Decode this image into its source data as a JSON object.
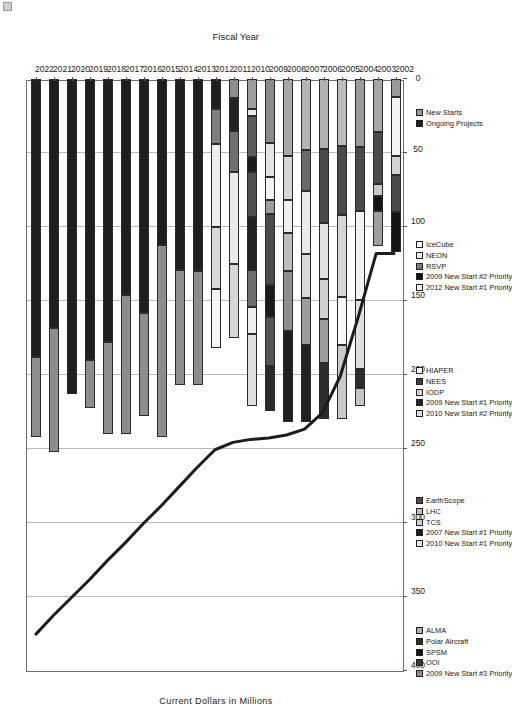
{
  "chart_data": {
    "type": "bar",
    "orientation": "horizontal",
    "stacked": true,
    "title": "",
    "xlabel": "Fiscal Year",
    "ylabel": "Current Dollars in Millions",
    "categories": [
      "2002",
      "2003",
      "2004",
      "2005",
      "2006",
      "2007",
      "2008",
      "2009",
      "2010",
      "2011",
      "2012",
      "2013",
      "2014",
      "2015",
      "2016",
      "2017",
      "2018",
      "2019",
      "2020",
      "2021",
      "2022"
    ],
    "value_ticks": [
      0,
      50,
      100,
      150,
      200,
      250,
      300,
      350,
      400
    ],
    "ylim": [
      0,
      400
    ],
    "grid": true,
    "legend_position": "right",
    "bar_totals": [
      117,
      113,
      221,
      230,
      230,
      232,
      232,
      224,
      221,
      202,
      182,
      207,
      207,
      242,
      228,
      240,
      240,
      222,
      213,
      252,
      242
    ],
    "annotation_line": {
      "name": "Budget Ceiling",
      "x": [
        "2002",
        "2003",
        "2004",
        "2005",
        "2006",
        "2007",
        "2008",
        "2009",
        "2010",
        "2011",
        "2012",
        "2013",
        "2014",
        "2015",
        "2016",
        "2017",
        "2018",
        "2019",
        "2020",
        "2021",
        "2022"
      ],
      "y": [
        117,
        117,
        160,
        200,
        225,
        236,
        240,
        242,
        243,
        245,
        250,
        262,
        275,
        288,
        300,
        313,
        325,
        338,
        350,
        362,
        375
      ]
    },
    "series": [
      {
        "name": "ALMA",
        "color": "#b0b0b0"
      },
      {
        "name": "Polar Aircraft",
        "color": "#2e2e2e"
      },
      {
        "name": "SPSM",
        "color": "#151515"
      },
      {
        "name": "OOI",
        "color": "#3a3a3a"
      },
      {
        "name": "2009 New Start #3 Priority",
        "color": "#8e8e8e"
      },
      {
        "name": "EarthScope",
        "color": "#4d4d4d"
      },
      {
        "name": "LHC",
        "color": "#bdbdbd"
      },
      {
        "name": "TCS",
        "color": "#cfcfcf"
      },
      {
        "name": "2007 New Start #1 Priority",
        "color": "#1c1c1c"
      },
      {
        "name": "2010 New Start #1 Priority",
        "color": "#e7e7e7"
      },
      {
        "name": "HIAPER",
        "color": "#fafafa"
      },
      {
        "name": "NEES",
        "color": "#3f3f3f"
      },
      {
        "name": "IODP",
        "color": "#d4d4d4"
      },
      {
        "name": "2009 New Start #1 Priority",
        "color": "#242424"
      },
      {
        "name": "2010 New Start #2 Priority",
        "color": "#dcdcdc"
      },
      {
        "name": "IceCube",
        "color": "#fdfdfd"
      },
      {
        "name": "NEON",
        "color": "#eaeaea"
      },
      {
        "name": "RSVP",
        "color": "#7a7a7a"
      },
      {
        "name": "2009 New Start #2 Priority",
        "color": "#111111"
      },
      {
        "name": "2012 New Start #1 Priority",
        "color": "#f2f2f2"
      },
      {
        "name": "New Starts",
        "color": "#9a9a9a"
      },
      {
        "name": "Ongoing Projects",
        "color": "#1f1f1f"
      }
    ],
    "bars": [
      {
        "year": "2002",
        "segments": [
          {
            "name": "ALMA",
            "value": 12,
            "color": "#9a9a9a"
          },
          {
            "name": "HIAPER",
            "value": 40,
            "color": "#f4f4f4"
          },
          {
            "name": "IODP",
            "value": 13,
            "color": "#d2d2d2"
          },
          {
            "name": "EarthScope",
            "value": 25,
            "color": "#4a4a4a"
          },
          {
            "name": "Polar Aircraft",
            "value": 27,
            "color": "#141414"
          }
        ]
      },
      {
        "year": "2003",
        "segments": [
          {
            "name": "ALMA",
            "value": 36,
            "color": "#a6a6a6"
          },
          {
            "name": "EarthScope",
            "value": 35,
            "color": "#4a4a4a"
          },
          {
            "name": "IODP",
            "value": 8,
            "color": "#c9c9c9"
          },
          {
            "name": "Polar Aircraft",
            "value": 10,
            "color": "#151515"
          },
          {
            "name": "NEES",
            "value": 24,
            "color": "#9f9f9f"
          }
        ]
      },
      {
        "year": "2004",
        "segments": [
          {
            "name": "ALMA",
            "value": 46,
            "color": "#9c9c9c"
          },
          {
            "name": "EarthScope",
            "value": 43,
            "color": "#4a4a4a"
          },
          {
            "name": "HIAPER",
            "value": 60,
            "color": "#f2f2f2"
          },
          {
            "name": "TCS",
            "value": 47,
            "color": "#e0e0e0"
          },
          {
            "name": "Polar Aircraft",
            "value": 13,
            "color": "#2b2b2b"
          },
          {
            "name": "IODP",
            "value": 12,
            "color": "#c4c4c4"
          }
        ]
      },
      {
        "year": "2005",
        "segments": [
          {
            "name": "ALMA",
            "value": 45,
            "color": "#bdbdbd"
          },
          {
            "name": "EarthScope",
            "value": 47,
            "color": "#4a4a4a"
          },
          {
            "name": "TCS",
            "value": 55,
            "color": "#d6d6d6"
          },
          {
            "name": "IceCube",
            "value": 33,
            "color": "#f7f7f7"
          },
          {
            "name": "IODP",
            "value": 50,
            "color": "#cacaca"
          }
        ]
      },
      {
        "year": "2006",
        "segments": [
          {
            "name": "ALMA",
            "value": 47,
            "color": "#b2b2b2"
          },
          {
            "name": "EarthScope",
            "value": 50,
            "color": "#4a4a4a"
          },
          {
            "name": "TCS",
            "value": 38,
            "color": "#e2e2e2"
          },
          {
            "name": "IceCube",
            "value": 27,
            "color": "#d0d0d0"
          },
          {
            "name": "IODP",
            "value": 30,
            "color": "#9b9b9b"
          },
          {
            "name": "Polar Aircraft",
            "value": 38,
            "color": "#2d2d2d"
          }
        ]
      },
      {
        "year": "2007",
        "segments": [
          {
            "name": "ALMA",
            "value": 48,
            "color": "#b5b5b5"
          },
          {
            "name": "EarthScope",
            "value": 28,
            "color": "#6a6a6a"
          },
          {
            "name": "TCS",
            "value": 42,
            "color": "#ebebeb"
          },
          {
            "name": "IceCube",
            "value": 30,
            "color": "#d8d8d8"
          },
          {
            "name": "IODP",
            "value": 32,
            "color": "#9d9d9d"
          },
          {
            "name": "2007 New Start #1 Priority",
            "value": 52,
            "color": "#222222"
          }
        ]
      },
      {
        "year": "2008",
        "segments": [
          {
            "name": "ALMA",
            "value": 52,
            "color": "#a8a8a8"
          },
          {
            "name": "EarthScope",
            "value": 30,
            "color": "#d7d7d7"
          },
          {
            "name": "TCS",
            "value": 22,
            "color": "#f0f0f0"
          },
          {
            "name": "IceCube",
            "value": 26,
            "color": "#bebebe"
          },
          {
            "name": "IODP",
            "value": 40,
            "color": "#8f8f8f"
          },
          {
            "name": "2007 New Start #1 Priority",
            "value": 62,
            "color": "#1f1f1f"
          }
        ]
      },
      {
        "year": "2009",
        "segments": [
          {
            "name": "ALMA",
            "value": 43,
            "color": "#8b8b8b"
          },
          {
            "name": "EarthScope",
            "value": 23,
            "color": "#e4e4e4"
          },
          {
            "name": "TCS",
            "value": 16,
            "color": "#f3f3f3"
          },
          {
            "name": "IceCube",
            "value": 9,
            "color": "#9c9c9c"
          },
          {
            "name": "IODP",
            "value": 48,
            "color": "#4b4b4b"
          },
          {
            "name": "2009 New Start #1 Priority",
            "value": 22,
            "color": "#1a1a1a"
          },
          {
            "name": "2009 New Start #2 Priority",
            "value": 33,
            "color": "#555555"
          },
          {
            "name": "2009 New Start #3 Priority",
            "value": 30,
            "color": "#2a2a2a"
          }
        ]
      },
      {
        "year": "2010",
        "segments": [
          {
            "name": "ALMA",
            "value": 20,
            "color": "#9e9e9e"
          },
          {
            "name": "NEON",
            "value": 5,
            "color": "#e8e8e8"
          },
          {
            "name": "IODP",
            "value": 28,
            "color": "#5a5a5a"
          },
          {
            "name": "EarthScope",
            "value": 10,
            "color": "#1b1b1b"
          },
          {
            "name": "TCS",
            "value": 30,
            "color": "#4e4e4e"
          },
          {
            "name": "2009 New Start #1 Priority",
            "value": 36,
            "color": "#222222"
          },
          {
            "name": "2009 New Start #2 Priority",
            "value": 25,
            "color": "#6c6c6c"
          },
          {
            "name": "2010 New Start #1 Priority",
            "value": 18,
            "color": "#ededed"
          },
          {
            "name": "2010 New Start #2 Priority",
            "value": 49,
            "color": "#dedede"
          }
        ]
      },
      {
        "year": "2011",
        "segments": [
          {
            "name": "ALMA",
            "value": 13,
            "color": "#8e8e8e"
          },
          {
            "name": "NEON",
            "value": 22,
            "color": "#232323"
          },
          {
            "name": "IODP",
            "value": 28,
            "color": "#6f6f6f"
          },
          {
            "name": "2010 New Start #1 Priority",
            "value": 62,
            "color": "#e9e9e9"
          },
          {
            "name": "2010 New Start #2 Priority",
            "value": 50,
            "color": "#d6d6d6"
          }
        ]
      },
      {
        "year": "2012",
        "segments": [
          {
            "name": "New Starts",
            "value": 20,
            "color": "#1f1f1f"
          },
          {
            "name": "RSVP",
            "value": 24,
            "color": "#7e7e7e"
          },
          {
            "name": "2012 New Start #1 Priority",
            "value": 56,
            "color": "#efefef"
          },
          {
            "name": "NEON",
            "value": 42,
            "color": "#d8d8d8"
          },
          {
            "name": "IceCube",
            "value": 40,
            "color": "#f6f6f6"
          }
        ]
      },
      {
        "year": "2013",
        "segments": [
          {
            "name": "Ongoing Projects",
            "value": 130,
            "color": "#1f1f1f"
          },
          {
            "name": "New Starts",
            "value": 77,
            "color": "#8d8d8d"
          }
        ]
      },
      {
        "year": "2014",
        "segments": [
          {
            "name": "Ongoing Projects",
            "value": 129,
            "color": "#1f1f1f"
          },
          {
            "name": "New Starts",
            "value": 78,
            "color": "#8d8d8d"
          }
        ]
      },
      {
        "year": "2015",
        "segments": [
          {
            "name": "Ongoing Projects",
            "value": 112,
            "color": "#1f1f1f"
          },
          {
            "name": "New Starts",
            "value": 130,
            "color": "#8d8d8d"
          }
        ]
      },
      {
        "year": "2016",
        "segments": [
          {
            "name": "Ongoing Projects",
            "value": 158,
            "color": "#1f1f1f"
          },
          {
            "name": "New Starts",
            "value": 70,
            "color": "#8d8d8d"
          }
        ]
      },
      {
        "year": "2017",
        "segments": [
          {
            "name": "Ongoing Projects",
            "value": 146,
            "color": "#1f1f1f"
          },
          {
            "name": "New Starts",
            "value": 94,
            "color": "#8d8d8d"
          }
        ]
      },
      {
        "year": "2018",
        "segments": [
          {
            "name": "Ongoing Projects",
            "value": 178,
            "color": "#1f1f1f"
          },
          {
            "name": "New Starts",
            "value": 62,
            "color": "#8d8d8d"
          }
        ]
      },
      {
        "year": "2019",
        "segments": [
          {
            "name": "Ongoing Projects",
            "value": 190,
            "color": "#1f1f1f"
          },
          {
            "name": "New Starts",
            "value": 32,
            "color": "#8d8d8d"
          }
        ]
      },
      {
        "year": "2020",
        "segments": [
          {
            "name": "Ongoing Projects",
            "value": 213,
            "color": "#1f1f1f"
          }
        ]
      },
      {
        "year": "2021",
        "segments": [
          {
            "name": "Ongoing Projects",
            "value": 168,
            "color": "#1f1f1f"
          },
          {
            "name": "New Starts",
            "value": 84,
            "color": "#8d8d8d"
          }
        ]
      },
      {
        "year": "2022",
        "segments": [
          {
            "name": "Ongoing Projects",
            "value": 188,
            "color": "#1f1f1f"
          },
          {
            "name": "New Starts",
            "value": 54,
            "color": "#8d8d8d"
          }
        ]
      }
    ],
    "legends": [
      {
        "id": "legend-new-starts",
        "items": [
          {
            "label": "New Starts",
            "color": "#9a9a9a"
          },
          {
            "label": "Ongoing Projects",
            "color": "#1f1f1f"
          }
        ]
      },
      {
        "id": "legend-icecube",
        "items": [
          {
            "label": "IceCube",
            "color": "#fdfdfd"
          },
          {
            "label": "NEON",
            "color": "#eaeaea"
          },
          {
            "label": "RSVP",
            "color": "#7a7a7a"
          },
          {
            "label": "2009 New Start #2 Priority",
            "color": "#111111"
          },
          {
            "label": "2012 New Start #1 Priority",
            "color": "#f2f2f2"
          }
        ]
      },
      {
        "id": "legend-hiaper",
        "items": [
          {
            "label": "HIAPER",
            "color": "#fafafa"
          },
          {
            "label": "NEES",
            "color": "#3f3f3f"
          },
          {
            "label": "IODP",
            "color": "#d4d4d4"
          },
          {
            "label": "2009 New Start #1 Priority",
            "color": "#242424"
          },
          {
            "label": "2010 New Start #2 Priority",
            "color": "#dcdcdc"
          }
        ]
      },
      {
        "id": "legend-earthscope",
        "items": [
          {
            "label": "EarthScope",
            "color": "#4d4d4d"
          },
          {
            "label": "LHC",
            "color": "#bdbdbd"
          },
          {
            "label": "TCS",
            "color": "#cfcfcf"
          },
          {
            "label": "2007 New Start #1 Priority",
            "color": "#1c1c1c"
          },
          {
            "label": "2010 New Start #1 Priority",
            "color": "#e7e7e7"
          }
        ]
      },
      {
        "id": "legend-alma",
        "items": [
          {
            "label": "ALMA",
            "color": "#b0b0b0"
          },
          {
            "label": "Polar Aircraft",
            "color": "#2e2e2e"
          },
          {
            "label": "SPSM",
            "color": "#151515"
          },
          {
            "label": "OOI",
            "color": "#3a3a3a"
          },
          {
            "label": "2009 New Start #3 Priority",
            "color": "#8e8e8e"
          }
        ]
      }
    ]
  }
}
